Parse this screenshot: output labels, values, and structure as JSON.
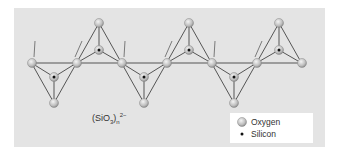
{
  "figure": {
    "formula": {
      "base": "(SiO",
      "sub3": "3",
      "close": ")",
      "sub_n": "n",
      "sup": "2−"
    },
    "legend": {
      "items": [
        {
          "label": "Oxygen",
          "symbol": "oxygen-atom"
        },
        {
          "label": "Silicon",
          "symbol": "silicon-atom"
        }
      ]
    },
    "colors": {
      "panel_bg": "#e4e4e4",
      "bond": "#555555",
      "oxygen_fill": "#c8c8c8",
      "silicon_dot": "#111111",
      "arrow": "#7a7a7a"
    },
    "structure": {
      "bridging_oxygens_x": [
        32,
        77,
        122,
        167,
        212,
        257,
        302
      ],
      "bridging_y": 63,
      "up_tetrahedra_x": [
        99,
        189,
        279
      ],
      "down_tetrahedra_x": [
        54,
        144,
        234
      ]
    }
  }
}
